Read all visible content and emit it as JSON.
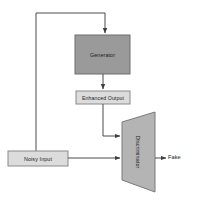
{
  "diagram": {
    "type": "block-diagram",
    "background_color": "#ffffff",
    "width": 197,
    "height": 206,
    "nodes": [
      {
        "id": "generator",
        "label": "Generator",
        "shape": "rectangle",
        "fill": "#9a9a9a",
        "stroke": "#6f6f6f",
        "x": 75,
        "y": 35,
        "w": 55,
        "h": 39
      },
      {
        "id": "enhanced-output",
        "label": "Enhanced Output",
        "shape": "rectangle",
        "fill": "#dcdcdc",
        "stroke": "#8a8a8a",
        "x": 76,
        "y": 91,
        "w": 54,
        "h": 13
      },
      {
        "id": "noisy-input",
        "label": "Noisy Input",
        "shape": "rectangle",
        "fill": "#dcdcdc",
        "stroke": "#8a8a8a",
        "x": 8,
        "y": 151,
        "w": 60,
        "h": 15
      },
      {
        "id": "discriminator",
        "label": "Discriminator",
        "shape": "trapezoid",
        "fill": "#b4b4b4",
        "stroke": "#7a7a7a",
        "rotation": 90,
        "x": 122,
        "y": 112,
        "w": 33,
        "h": 80
      }
    ],
    "output_label": {
      "id": "fake",
      "text": "Fake"
    },
    "edges": [
      {
        "id": "noisy-input-to-generator",
        "from": "noisy-input",
        "to": "generator",
        "label": "",
        "style": "orthogonal-feedback"
      },
      {
        "id": "generator-to-enhanced-output",
        "from": "generator",
        "to": "enhanced-output",
        "label": "",
        "style": "straight"
      },
      {
        "id": "enhanced-output-to-discriminator",
        "from": "enhanced-output",
        "to": "discriminator",
        "label": "",
        "style": "orthogonal"
      },
      {
        "id": "noisy-input-to-discriminator",
        "from": "noisy-input",
        "to": "discriminator",
        "label": "",
        "style": "straight"
      },
      {
        "id": "discriminator-to-fake",
        "from": "discriminator",
        "to": "fake",
        "label": "",
        "style": "straight"
      }
    ],
    "line_color": "#4a4a4a"
  }
}
